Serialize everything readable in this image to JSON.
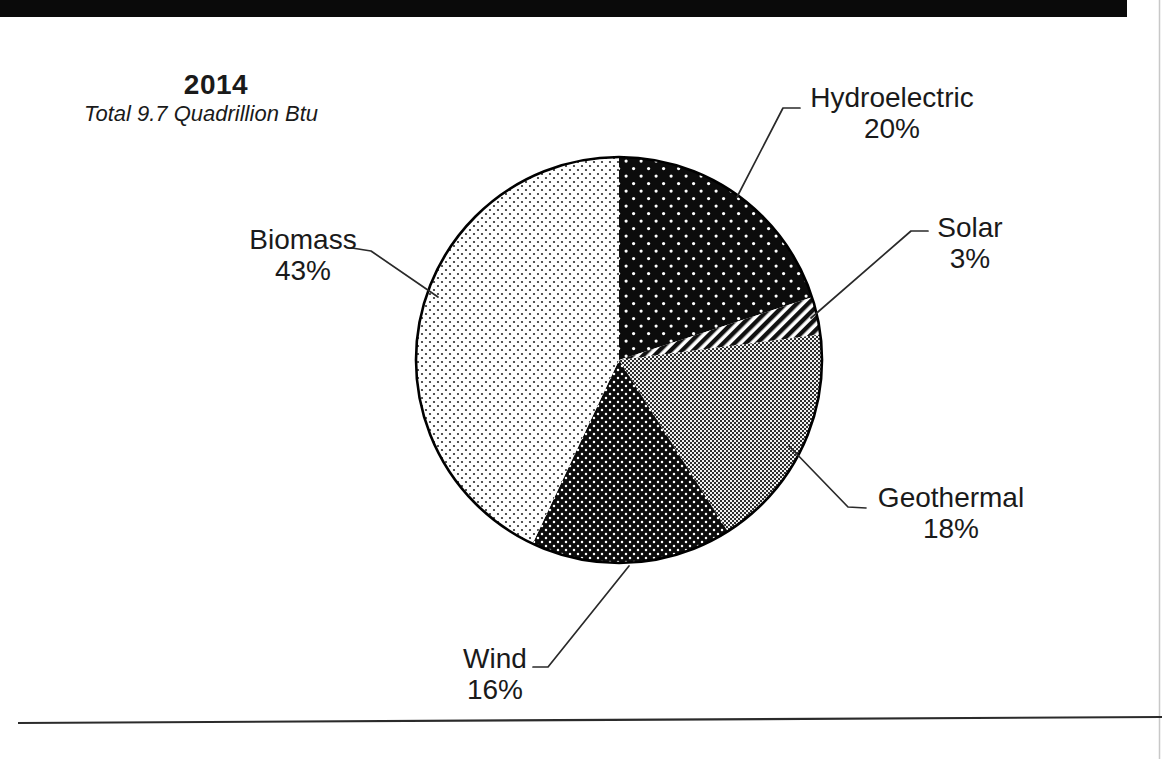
{
  "page": {
    "background_color": "#ffffff",
    "ink_color": "#1a1a1a"
  },
  "header": {
    "year_title": "2014",
    "total_subtitle": "Total 9.7 Quadrillion Btu"
  },
  "chart_data": {
    "type": "pie",
    "title": "2014",
    "subtitle": "Total 9.7 Quadrillion Btu",
    "units": "Quadrillion Btu",
    "total_value": 9.7,
    "start_angle_deg": -90,
    "direction": "clockwise",
    "legend_position": "none (leader-line labels around pie)",
    "slices": [
      {
        "label": "Hydroelectric",
        "value": 20,
        "pct_label": "20%",
        "pattern": "sparse-white-dots-on-black"
      },
      {
        "label": "Solar",
        "value": 3,
        "pct_label": "3%",
        "pattern": "diagonal-stripes"
      },
      {
        "label": "Geothermal",
        "value": 18,
        "pct_label": "18%",
        "pattern": "gray-checker-weave"
      },
      {
        "label": "Wind",
        "value": 16,
        "pct_label": "16%",
        "pattern": "dense-white-dots-on-black"
      },
      {
        "label": "Biomass",
        "value": 43,
        "pct_label": "43%",
        "pattern": "black-dots-on-white"
      }
    ]
  },
  "scan_artifacts": {
    "top_bar_color": "#0a0a0a",
    "bottom_rule_color": "#2b2b2b",
    "right_edge_color": "#c8c8c8"
  }
}
